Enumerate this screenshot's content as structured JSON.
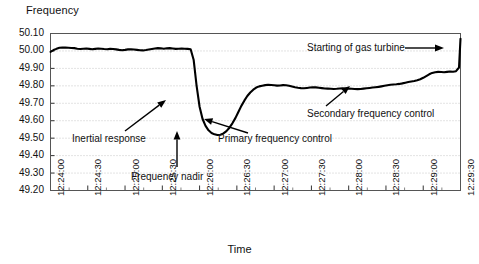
{
  "chart_data": {
    "type": "line",
    "title": "",
    "ylabel": "Frequency",
    "xlabel": "Time",
    "ylim": [
      49.2,
      50.1
    ],
    "yticks": [
      "49.20",
      "49.30",
      "49.40",
      "49.50",
      "49.60",
      "49.70",
      "49.80",
      "49.90",
      "50.00",
      "50.10"
    ],
    "xticks": [
      "12:24:00",
      "12:24:30",
      "12:25:00",
      "12:25:30",
      "12:26:00",
      "12:26:30",
      "12:27:00",
      "12:27:30",
      "12:28:00",
      "12:28:30",
      "12:29:00",
      "12:29:30"
    ],
    "grid": true,
    "grid_style": "dotted-horizontal",
    "legend": "none",
    "line_color": "#000000",
    "series": [
      {
        "name": "Frequency",
        "x": [
          0.0,
          0.04,
          0.08,
          0.12,
          0.16,
          0.2,
          0.24,
          0.28,
          0.32,
          0.36,
          0.4,
          0.44,
          0.48,
          0.52,
          0.56,
          0.6,
          0.64,
          0.68,
          0.72,
          0.76,
          0.8,
          0.84,
          0.88,
          0.92,
          0.96,
          1.0,
          1.04,
          1.08,
          1.12,
          1.16,
          1.2,
          1.24,
          1.28,
          1.32,
          1.36,
          1.4,
          1.44,
          1.48,
          1.52,
          1.56,
          1.6,
          1.64,
          1.68,
          1.72,
          1.76,
          1.8,
          1.84,
          1.88,
          1.92,
          1.96,
          2.0,
          2.04,
          2.08,
          2.12,
          2.16,
          2.2,
          2.24,
          2.28,
          2.32,
          2.36,
          2.4,
          2.44,
          2.48,
          2.52,
          2.56,
          2.6,
          2.64,
          2.68,
          2.72,
          2.76,
          2.8,
          2.84,
          2.88,
          2.92,
          2.96,
          3.0,
          3.04,
          3.08,
          3.12,
          3.16,
          3.2,
          3.24,
          3.28,
          3.32,
          3.36,
          3.4,
          3.44,
          3.48,
          3.52,
          3.56,
          3.6,
          3.64,
          3.68,
          3.72,
          3.76,
          3.8,
          3.84,
          3.88,
          3.92,
          3.96,
          4.0,
          4.04,
          4.08,
          4.12,
          4.16,
          4.2,
          4.24,
          4.28,
          4.32,
          4.36,
          4.4,
          4.44,
          4.48,
          4.52,
          4.56,
          4.6,
          4.64,
          4.68,
          4.72,
          4.76,
          4.8,
          4.84,
          4.88,
          4.92,
          4.96,
          5.0,
          5.04,
          5.08,
          5.12,
          5.16,
          5.2,
          5.24,
          5.28,
          5.32,
          5.36,
          5.4,
          5.44,
          5.48,
          5.5
        ],
        "y": [
          49.995,
          50.005,
          50.012,
          50.018,
          50.02,
          50.019,
          50.018,
          50.017,
          50.016,
          50.013,
          50.011,
          50.013,
          50.014,
          50.012,
          50.01,
          50.012,
          50.014,
          50.013,
          50.011,
          50.01,
          50.012,
          50.011,
          50.009,
          50.006,
          50.004,
          50.006,
          50.009,
          50.01,
          50.008,
          50.006,
          50.004,
          50.003,
          50.005,
          50.008,
          50.011,
          50.014,
          50.016,
          50.015,
          50.013,
          50.015,
          50.016,
          50.014,
          50.012,
          50.013,
          50.014,
          50.013,
          50.012,
          50.01,
          49.95,
          49.8,
          49.68,
          49.61,
          49.57,
          49.545,
          49.53,
          49.522,
          49.518,
          49.52,
          49.527,
          49.54,
          49.56,
          49.585,
          49.615,
          49.65,
          49.685,
          49.715,
          49.742,
          49.762,
          49.778,
          49.79,
          49.797,
          49.801,
          49.804,
          49.806,
          49.805,
          49.803,
          49.801,
          49.802,
          49.804,
          49.803,
          49.8,
          49.796,
          49.792,
          49.789,
          49.787,
          49.786,
          49.788,
          49.79,
          49.792,
          49.791,
          49.789,
          49.787,
          49.785,
          49.784,
          49.783,
          49.782,
          49.783,
          49.785,
          49.786,
          49.785,
          49.784,
          49.783,
          49.782,
          49.781,
          49.782,
          49.784,
          49.786,
          49.788,
          49.79,
          49.792,
          49.794,
          49.797,
          49.8,
          49.803,
          49.806,
          49.808,
          49.809,
          49.811,
          49.814,
          49.818,
          49.822,
          49.825,
          49.828,
          49.832,
          49.838,
          49.846,
          49.856,
          49.866,
          49.874,
          49.878,
          49.88,
          49.879,
          49.878,
          49.88,
          49.882,
          49.881,
          49.884,
          49.905,
          50.07
        ]
      }
    ],
    "annotations": [
      {
        "label": "Inertial response",
        "arrow": "up-right"
      },
      {
        "label": "Frequency nadir",
        "arrow": "up"
      },
      {
        "label": "Primary frequency control",
        "arrow": "up-left"
      },
      {
        "label": "Secondary frequency control",
        "arrow": "up-right"
      },
      {
        "label": "Starting of gas turbine",
        "arrow": "right"
      }
    ]
  },
  "annotations": {
    "inertial_response": "Inertial response",
    "frequency_nadir": "Frequency nadir",
    "primary_frequency_control": "Primary frequency control",
    "secondary_frequency_control": "Secondary frequency control",
    "starting_of_gas_turbine": "Starting of gas turbine"
  }
}
